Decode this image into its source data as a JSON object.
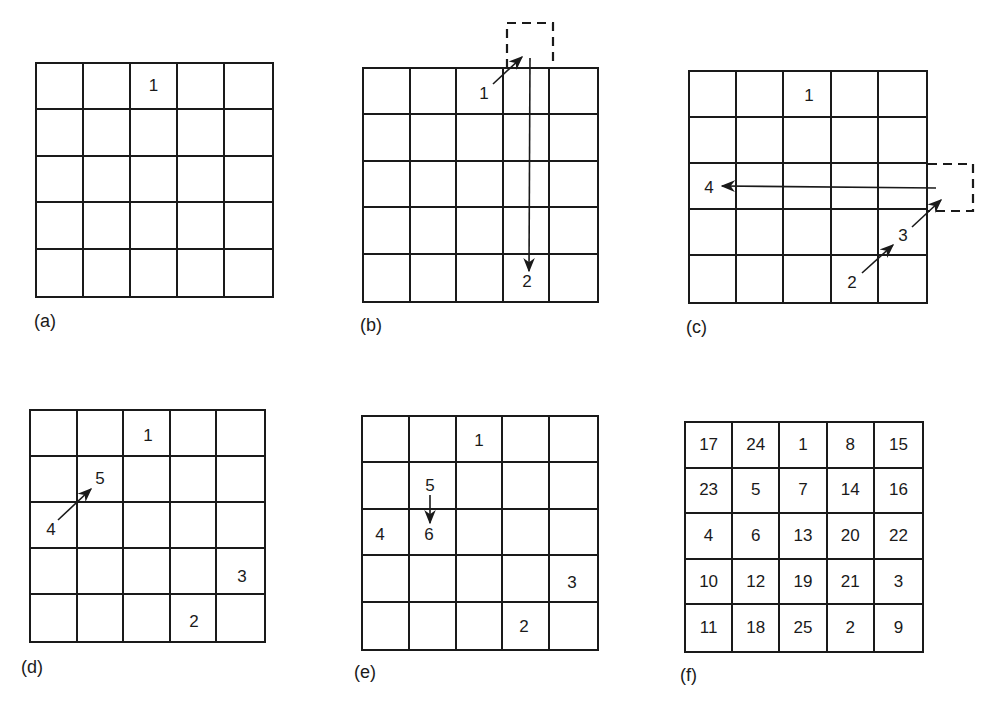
{
  "figure": {
    "panels": [
      {
        "id": "a",
        "label": "(a)",
        "grid_size": 5,
        "cells": [
          [
            "",
            "",
            "1",
            "",
            ""
          ],
          [
            "",
            "",
            "",
            "",
            ""
          ],
          [
            "",
            "",
            "",
            "",
            ""
          ],
          [
            "",
            "",
            "",
            "",
            ""
          ],
          [
            "",
            "",
            "",
            "",
            ""
          ]
        ],
        "annotations": []
      },
      {
        "id": "b",
        "label": "(b)",
        "grid_size": 5,
        "floating_numbers": [
          {
            "text": "1",
            "note": "start position row 1 col 3"
          },
          {
            "text": "2",
            "note": "placed row 5 col 4"
          }
        ],
        "annotations": [
          {
            "type": "arrow",
            "from": "1",
            "to": "dashed cell above row 1 col 4"
          },
          {
            "type": "dashed-cell",
            "position": "above row 1, col 4"
          },
          {
            "type": "arrow",
            "from": "dashed cell",
            "to": "2",
            "direction": "down"
          }
        ]
      },
      {
        "id": "c",
        "label": "(c)",
        "grid_size": 5,
        "floating_numbers": [
          {
            "text": "1",
            "note": "row 1 col 3"
          },
          {
            "text": "2",
            "note": "row 5 col 4"
          },
          {
            "text": "3",
            "note": "row 4 col 5"
          },
          {
            "text": "4",
            "note": "row 3 col 1"
          }
        ],
        "annotations": [
          {
            "type": "arrow",
            "from": "2",
            "to": "3"
          },
          {
            "type": "arrow",
            "from": "3",
            "to": "dashed cell right of row 3"
          },
          {
            "type": "dashed-cell",
            "position": "right of row 3, col 5"
          },
          {
            "type": "arrow",
            "from": "dashed cell",
            "to": "4",
            "direction": "left"
          }
        ]
      },
      {
        "id": "d",
        "label": "(d)",
        "grid_size": 5,
        "floating_numbers": [
          {
            "text": "1",
            "note": "row 1 col 3"
          },
          {
            "text": "5",
            "note": "row 2 col 2"
          },
          {
            "text": "4",
            "note": "row 3 col 1"
          },
          {
            "text": "3",
            "note": "row 4 col 5"
          },
          {
            "text": "2",
            "note": "row 5 col 4"
          }
        ],
        "annotations": [
          {
            "type": "arrow",
            "from": "4",
            "to": "5"
          }
        ]
      },
      {
        "id": "e",
        "label": "(e)",
        "grid_size": 5,
        "floating_numbers": [
          {
            "text": "1",
            "note": "row 1 col 3"
          },
          {
            "text": "5",
            "note": "row 2 col 2"
          },
          {
            "text": "4",
            "note": "row 3 col 1"
          },
          {
            "text": "6",
            "note": "row 3 col 2"
          },
          {
            "text": "3",
            "note": "row 4 col 5"
          },
          {
            "text": "2",
            "note": "row 5 col 4"
          }
        ],
        "annotations": [
          {
            "type": "arrow",
            "from": "5",
            "to": "6",
            "direction": "down"
          }
        ]
      },
      {
        "id": "f",
        "label": "(f)",
        "grid_size": 5,
        "cells": [
          [
            "17",
            "24",
            "1",
            "8",
            "15"
          ],
          [
            "23",
            "5",
            "7",
            "14",
            "16"
          ],
          [
            "4",
            "6",
            "13",
            "20",
            "22"
          ],
          [
            "10",
            "12",
            "19",
            "21",
            "3"
          ],
          [
            "11",
            "18",
            "25",
            "2",
            "9"
          ]
        ]
      }
    ]
  },
  "panel_a": {
    "label": "(a)",
    "cells": [
      "",
      "",
      "1",
      "",
      "",
      "",
      "",
      "",
      "",
      "",
      "",
      "",
      "",
      "",
      "",
      "",
      "",
      "",
      "",
      "",
      "",
      "",
      "",
      "",
      ""
    ]
  },
  "panel_b": {
    "label": "(b)",
    "n1": "1",
    "n2": "2"
  },
  "panel_c": {
    "label": "(c)",
    "n1": "1",
    "n2": "2",
    "n3": "3",
    "n4": "4"
  },
  "panel_d": {
    "label": "(d)",
    "n1": "1",
    "n2": "2",
    "n3": "3",
    "n4": "4",
    "n5": "5"
  },
  "panel_e": {
    "label": "(e)",
    "n1": "1",
    "n2": "2",
    "n3": "3",
    "n4": "4",
    "n5": "5",
    "n6": "6"
  },
  "panel_f": {
    "label": "(f)",
    "cells": [
      "17",
      "24",
      "1",
      "8",
      "15",
      "23",
      "5",
      "7",
      "14",
      "16",
      "4",
      "6",
      "13",
      "20",
      "22",
      "10",
      "12",
      "19",
      "21",
      "3",
      "11",
      "18",
      "25",
      "2",
      "9"
    ]
  }
}
